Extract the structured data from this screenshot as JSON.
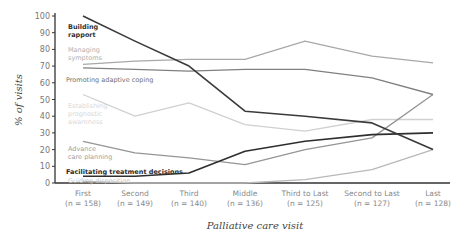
{
  "chart_data": {
    "type": "line",
    "title": "",
    "xlabel": "Palliative care visit",
    "ylabel": "% of visits",
    "ylim": [
      0,
      100
    ],
    "yticks": [
      0,
      10,
      20,
      30,
      40,
      50,
      60,
      70,
      80,
      90,
      100
    ],
    "grid": false,
    "legend_position": "inline labels at left",
    "categories": [
      "First",
      "Second",
      "Third",
      "Middle",
      "Third to Last",
      "Second to Last",
      "Last"
    ],
    "category_counts": [
      "(n = 158)",
      "(n = 149)",
      "(n = 140)",
      "(n = 136)",
      "(n = 125)",
      "(n = 127)",
      "(n = 128)"
    ],
    "series": [
      {
        "name": "Building rapport",
        "label_lines": [
          "Building",
          "rapport"
        ],
        "color": "#3a3a3a",
        "label_color": "#333333",
        "bold": true,
        "values": [
          100,
          85,
          70,
          43,
          40,
          36,
          20
        ]
      },
      {
        "name": "Managing symptoms",
        "label_lines": [
          "Managing",
          "symptoms"
        ],
        "color": "#a8a8a8",
        "label_color": "#b0b0b0",
        "bold": false,
        "values": [
          71,
          73,
          74,
          74,
          85,
          76,
          72
        ]
      },
      {
        "name": "Promoting adaptive coping",
        "label_lines": [
          "Promoting adaptive coping"
        ],
        "color": "#808080",
        "label_color": "#707070",
        "bold": false,
        "values": [
          69,
          68,
          67,
          68,
          68,
          63,
          53
        ]
      },
      {
        "name": "Establishing prognostic awareness",
        "label_lines": [
          "Establishing",
          "prognostic",
          "awareness"
        ],
        "color": "#d0d0d0",
        "label_color": "#d8d8d8",
        "bold": false,
        "values": [
          53,
          40,
          48,
          35,
          31,
          38,
          38
        ]
      },
      {
        "name": "Advance care planning",
        "label_lines": [
          "Advance",
          "care planning"
        ],
        "color": "#959595",
        "label_color": "#a0a0a0",
        "bold": false,
        "values": [
          25,
          18,
          15,
          11,
          20,
          27,
          53
        ]
      },
      {
        "name": "Facilitating treatment decisions",
        "label_lines": [
          "Facilitating treatment decisions"
        ],
        "color": "#2e2e2e",
        "label_color": "#2a2a2a",
        "bold": true,
        "values": [
          4,
          4,
          6,
          19,
          25,
          29,
          30
        ]
      },
      {
        "name": "Guiding disposition",
        "label_lines": [
          "Guiding disposition"
        ],
        "color": "#b8b8b8",
        "label_color": "#c4c4c4",
        "bold": false,
        "values": [
          1,
          0,
          0,
          0,
          2,
          8,
          20
        ]
      }
    ]
  }
}
